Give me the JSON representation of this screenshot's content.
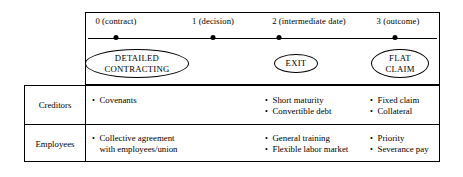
{
  "figure": {
    "timeline": {
      "ticks": [
        {
          "label": "0 (contract)",
          "x": 116
        },
        {
          "label": "1 (decision)",
          "x": 213
        },
        {
          "label": "2 (intermediate date)",
          "x": 309
        },
        {
          "label": "3 (outcome)",
          "x": 398
        }
      ],
      "stages": [
        {
          "line1": "DETAILED",
          "line2": "CONTRACTING",
          "x": 137,
          "w": 104,
          "h": 29
        },
        {
          "line1": "EXIT",
          "line2": "",
          "x": 296,
          "w": 44,
          "h": 19
        },
        {
          "line1": "FLAT",
          "line2": "CLAIM",
          "x": 400,
          "w": 58,
          "h": 29
        }
      ]
    },
    "rows": [
      {
        "label": "Creditors",
        "groups": [
          {
            "x": 92,
            "items": [
              {
                "text": "Covenants"
              }
            ]
          },
          {
            "x": 265,
            "items": [
              {
                "text": "Short maturity"
              },
              {
                "text": "Convertible debt"
              }
            ]
          },
          {
            "x": 370,
            "items": [
              {
                "text": "Fixed claim"
              },
              {
                "text": "Collateral"
              }
            ]
          }
        ]
      },
      {
        "label": "Employees",
        "groups": [
          {
            "x": 92,
            "items": [
              {
                "text": "Collective agreement",
                "cont": "with employees/union"
              }
            ]
          },
          {
            "x": 265,
            "items": [
              {
                "text": "General training"
              },
              {
                "text": "Flexible labor market"
              }
            ]
          },
          {
            "x": 370,
            "items": [
              {
                "text": "Priority"
              },
              {
                "text": "Severance pay"
              }
            ]
          }
        ]
      }
    ],
    "colors": {
      "line": "#000000",
      "background": "#ffffff"
    }
  }
}
